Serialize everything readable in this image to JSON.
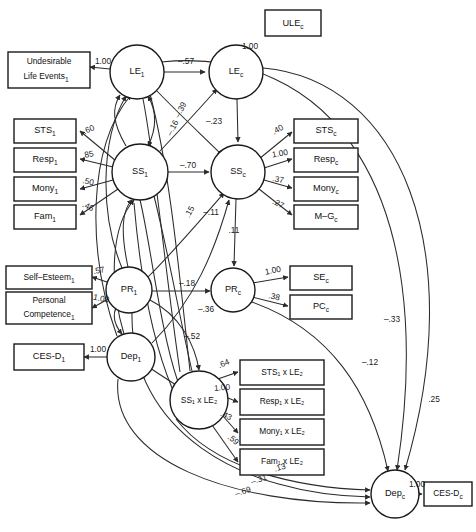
{
  "diagram": {
    "type": "structural-equation-model-path-diagram",
    "width": 476,
    "height": 532,
    "stroke_color": "#2b2b2b",
    "background": "#ffffff"
  },
  "observed_variables": [
    {
      "id": "ule_c",
      "label": "ULE",
      "sub": "c",
      "x": 265,
      "y": 22,
      "w": 56,
      "h": 26
    },
    {
      "id": "ule_1",
      "label": "Undesirable",
      "label2": "Life Events",
      "sub": "1",
      "x": 8,
      "y": 50,
      "w": 78,
      "h": 34
    },
    {
      "id": "sts_1",
      "label": "STS",
      "sub": "1",
      "x": 14,
      "y": 118,
      "w": 62,
      "h": 23
    },
    {
      "id": "resp_1",
      "label": "Resp",
      "sub": "1",
      "x": 14,
      "y": 147,
      "w": 62,
      "h": 23
    },
    {
      "id": "mony_1",
      "label": "Mony",
      "sub": "1",
      "x": 14,
      "y": 176,
      "w": 62,
      "h": 23
    },
    {
      "id": "fam_1",
      "label": "Fam",
      "sub": "1",
      "x": 14,
      "y": 205,
      "w": 62,
      "h": 23
    },
    {
      "id": "sts_c",
      "label": "STS",
      "sub": "c",
      "x": 297,
      "y": 118,
      "w": 62,
      "h": 23
    },
    {
      "id": "resp_c",
      "label": "Resp",
      "sub": "c",
      "x": 297,
      "y": 147,
      "w": 62,
      "h": 23
    },
    {
      "id": "mony_c",
      "label": "Mony",
      "sub": "c",
      "x": 297,
      "y": 176,
      "w": 62,
      "h": 23
    },
    {
      "id": "mg_c",
      "label": "M–G",
      "sub": "c",
      "x": 297,
      "y": 205,
      "w": 62,
      "h": 23
    },
    {
      "id": "self_esteem_1",
      "label": "Self–Esteem",
      "sub": "1",
      "x": 6,
      "y": 265,
      "w": 82,
      "h": 23
    },
    {
      "id": "pers_comp_1",
      "label": "Personal",
      "label2": "Competence",
      "sub": "1",
      "x": 6,
      "y": 291,
      "w": 82,
      "h": 30
    },
    {
      "id": "cesd_1",
      "label": "CES-D",
      "sub": "1",
      "x": 14,
      "y": 345,
      "w": 66,
      "h": 26
    },
    {
      "id": "se_c",
      "label": "SE",
      "sub": "c",
      "x": 292,
      "y": 265,
      "w": 62,
      "h": 23
    },
    {
      "id": "pc_c",
      "label": "PC",
      "sub": "c",
      "x": 292,
      "y": 294,
      "w": 62,
      "h": 23
    },
    {
      "id": "sts1_le2",
      "label": "STS₁ x LE₂",
      "x": 242,
      "y": 371,
      "w": 80,
      "h": 25
    },
    {
      "id": "resp1_le2",
      "label": "Resp₁ x LE₂",
      "x": 242,
      "y": 399,
      "w": 80,
      "h": 25
    },
    {
      "id": "mony1_le2",
      "label": "Mony₁ x LE₂",
      "x": 242,
      "y": 427,
      "w": 80,
      "h": 25
    },
    {
      "id": "fam1_le2",
      "label": "Fam₁ x LE₂",
      "x": 242,
      "y": 455,
      "w": 80,
      "h": 25
    },
    {
      "id": "cesd_c",
      "label": "CES-D",
      "sub": "c",
      "x": 424,
      "y": 484,
      "w": 48,
      "h": 24
    }
  ],
  "latent_variables": [
    {
      "id": "le_1",
      "label": "LE",
      "sub": "1",
      "cx": 137,
      "cy": 72,
      "r": 27
    },
    {
      "id": "le_c",
      "label": "LE",
      "sub": "c",
      "cx": 236,
      "cy": 72,
      "r": 27
    },
    {
      "id": "ss_1",
      "label": "SS",
      "sub": "1",
      "cx": 140,
      "cy": 172,
      "r": 28
    },
    {
      "id": "ss_c",
      "label": "SS",
      "sub": "c",
      "cx": 238,
      "cy": 172,
      "r": 27
    },
    {
      "id": "pr_1",
      "label": "PR",
      "sub": "1",
      "cx": 129,
      "cy": 290,
      "r": 23
    },
    {
      "id": "pr_c",
      "label": "PR",
      "sub": "c",
      "cx": 233,
      "cy": 290,
      "r": 22
    },
    {
      "id": "dep_1",
      "label": "Dep",
      "sub": "1",
      "cx": 131,
      "cy": 357,
      "r": 24
    },
    {
      "id": "ss1_le2",
      "label": "SS₁ x LE₂",
      "cx": 199,
      "cy": 400,
      "r": 29
    },
    {
      "id": "dep_c",
      "label": "Dep",
      "sub": "c",
      "cx": 395,
      "cy": 494,
      "r": 24
    }
  ],
  "paths": [
    {
      "id": "le1-ule1",
      "from": "le_1",
      "to": "ule_1",
      "coef": "1.00",
      "lx": 103,
      "ly": 64
    },
    {
      "id": "lec-ulec",
      "from": "le_c",
      "to": "ule_c",
      "coef": "1.00",
      "lx": 250,
      "ly": 50
    },
    {
      "id": "le1-lec",
      "from": "le_1",
      "to": "le_c",
      "coef": "–.57",
      "lx": 186,
      "ly": 63
    },
    {
      "id": "lec-ssc",
      "from": "le_c",
      "to": "ss_c",
      "coef": "–.23",
      "lx": 213,
      "ly": 122
    },
    {
      "id": "ss1-ssc",
      "from": "ss_1",
      "to": "ss_c",
      "coef": "–.70",
      "lx": 188,
      "ly": 168
    },
    {
      "id": "ss1-lec",
      "from": "ss_1",
      "to": "le_c",
      "coef": "–.39",
      "lx": 180,
      "ly": 110
    },
    {
      "id": "le1-ssc",
      "from": "le_1",
      "to": "ss_c",
      "coef": "–.16",
      "lx": 172,
      "ly": 128
    },
    {
      "id": "pr1-ssc",
      "from": "pr_1",
      "to": "ss_c",
      "coef": ".15",
      "lx": 189,
      "ly": 212
    },
    {
      "id": "dep1-ssc",
      "from": "dep_1",
      "to": "ss_c",
      "coef": "–.11",
      "lx": 210,
      "ly": 218
    },
    {
      "id": "ssc-prc",
      "from": "ss_c",
      "to": "pr_c",
      "coef": ".11",
      "lx": 233,
      "ly": 232
    },
    {
      "id": "pr1-prc",
      "from": "pr_1",
      "to": "pr_c",
      "coef": "–.18",
      "lx": 187,
      "ly": 285
    },
    {
      "id": "pr1-ss1le2",
      "from": "pr_1",
      "to": "ss1_le2",
      "coef": "–.36",
      "lx": 205,
      "ly": 312
    },
    {
      "id": "dep1-ss1le2",
      "from": "dep_1",
      "to": "ss1_le2",
      "coef": "–.52",
      "lx": 191,
      "ly": 337
    },
    {
      "id": "ss1-sts1",
      "from": "ss_1",
      "to": "sts_1",
      "coef": ".60",
      "lx": 88,
      "ly": 133
    },
    {
      "id": "ss1-resp1",
      "from": "ss_1",
      "to": "resp_1",
      "coef": ".85",
      "lx": 87,
      "ly": 157
    },
    {
      "id": "ss1-mony1",
      "from": "ss_1",
      "to": "mony_1",
      "coef": ".50",
      "lx": 87,
      "ly": 184
    },
    {
      "id": "ss1-fam1",
      "from": "ss_1",
      "to": "fam_1",
      "coef": ".46",
      "lx": 87,
      "ly": 209
    },
    {
      "id": "ssc-stsc",
      "from": "ss_c",
      "to": "sts_c",
      "coef": ".40",
      "lx": 277,
      "ly": 131
    },
    {
      "id": "ssc-respc",
      "from": "ss_c",
      "to": "resp_c",
      "coef": "1.00",
      "lx": 279,
      "ly": 155
    },
    {
      "id": "ssc-monyc",
      "from": "ss_c",
      "to": "mony_c",
      "coef": ".37",
      "lx": 277,
      "ly": 181
    },
    {
      "id": "ssc-mgc",
      "from": "ss_c",
      "to": "mg_c",
      "coef": ".27",
      "lx": 277,
      "ly": 205
    },
    {
      "id": "pr1-se1",
      "from": "pr_1",
      "to": "self_esteem_1",
      "coef": ".57",
      "lx": 97,
      "ly": 272
    },
    {
      "id": "pr1-pc1",
      "from": "pr_1",
      "to": "pers_comp_1",
      "coef": "1.00",
      "lx": 99,
      "ly": 300
    },
    {
      "id": "dep1-cesd1",
      "from": "dep_1",
      "to": "cesd_1",
      "coef": "1.00",
      "lx": 98,
      "ly": 350
    },
    {
      "id": "prc-sec",
      "from": "pr_c",
      "to": "se_c",
      "coef": "1.00",
      "lx": 272,
      "ly": 272
    },
    {
      "id": "prc-pcc",
      "from": "pr_c",
      "to": "pc_c",
      "coef": ".38",
      "lx": 273,
      "ly": 298
    },
    {
      "id": "ss1le2-sts1le2",
      "from": "ss1_le2",
      "to": "sts1_le2",
      "coef": ".64",
      "lx": 224,
      "ly": 364
    },
    {
      "id": "ss1le2-resp1le2",
      "from": "ss1_le2",
      "to": "resp1_le2",
      "coef": "1.00",
      "lx": 222,
      "ly": 389
    },
    {
      "id": "ss1le2-mony1le2",
      "from": "ss1_le2",
      "to": "mony1_le2",
      "coef": ".43",
      "lx": 225,
      "ly": 419
    },
    {
      "id": "ss1le2-fam1le2",
      "from": "ss1_le2",
      "to": "fam1_le2",
      "coef": ".59",
      "lx": 230,
      "ly": 441
    },
    {
      "id": "depc-cesdc",
      "from": "dep_c",
      "to": "cesd_c",
      "coef": "1.00",
      "lx": 418,
      "ly": 486
    },
    {
      "id": "lec-depc",
      "from": "le_c",
      "to": "dep_c",
      "coef": ".25",
      "lx": 432,
      "ly": 400
    },
    {
      "id": "le1-depc",
      "from": "le_1",
      "to": "dep_c",
      "coef": "–.33",
      "lx": 391,
      "ly": 321
    },
    {
      "id": "prc-depc",
      "from": "pr_c",
      "to": "dep_c",
      "coef": "–.12",
      "lx": 370,
      "ly": 364
    },
    {
      "id": "ss1le2-depc",
      "from": "ss1_le2",
      "to": "dep_c",
      "coef": ".13",
      "lx": 279,
      "ly": 470
    },
    {
      "id": "pr1-depc",
      "from": "pr_1",
      "to": "dep_c",
      "coef": "–.31",
      "lx": 259,
      "ly": 481
    },
    {
      "id": "dep1-depc",
      "from": "dep_1",
      "to": "dep_c",
      "coef": "–.69",
      "lx": 243,
      "ly": 493
    }
  ]
}
